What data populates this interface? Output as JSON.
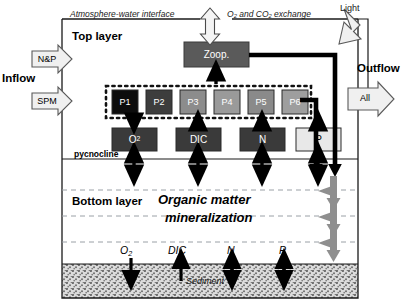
{
  "figure": {
    "type": "diagram",
    "canvas": {
      "width": 408,
      "height": 308
    }
  },
  "top": {
    "atmosphere_label": "Atmosphere-water interface",
    "exchange_label_a": "O",
    "exchange_label_a_sub": "2",
    "exchange_label_b": " and CO",
    "exchange_label_b_sub": "2",
    "exchange_label_c": " exchange",
    "light_label": "Light",
    "top_layer_label": "Top layer"
  },
  "inflow": {
    "title": "Inflow",
    "arrows": [
      {
        "label": "N&P"
      },
      {
        "label": "SPM"
      }
    ]
  },
  "outflow": {
    "title": "Outflow",
    "arrow_label": "All"
  },
  "zooplankton": {
    "label": "Zoop."
  },
  "phytoplankton": {
    "group_label": "phytoplankton group",
    "boxes": [
      {
        "label": "P1",
        "fill": "#0c0c0c",
        "text": "#ffffff"
      },
      {
        "label": "P2",
        "fill": "#3d3d3d",
        "text": "#ffffff"
      },
      {
        "label": "P3",
        "fill": "#8c8c8c",
        "text": "#ffffff"
      },
      {
        "label": "P4",
        "fill": "#9a9a9a",
        "text": "#ffffff"
      },
      {
        "label": "P5",
        "fill": "#8a8a8a",
        "text": "#ffffff"
      },
      {
        "label": "P6",
        "fill": "#9e9e9e",
        "text": "#ffffff"
      }
    ]
  },
  "nutrients": [
    {
      "label": "O",
      "sub": "2",
      "fill": "#3a3a3a",
      "text": "#ffffff"
    },
    {
      "label": "DIC",
      "sub": "",
      "fill": "#3a3a3a",
      "text": "#ffffff"
    },
    {
      "label": "N",
      "sub": "",
      "fill": "#3a3a3a",
      "text": "#ffffff"
    },
    {
      "label": "P",
      "sub": "",
      "fill": "#e8e8e8",
      "text": "#000000"
    }
  ],
  "pycnocline": {
    "label": "pycnocline"
  },
  "bottom": {
    "layer_label": "Bottom layer",
    "process_line1": "Organic matter",
    "process_line2": "mineralization"
  },
  "sediment": {
    "label": "Sediment",
    "fluxes": [
      {
        "label": "O",
        "sub": "2"
      },
      {
        "label": "DIC",
        "sub": ""
      },
      {
        "label": "N",
        "sub": ""
      },
      {
        "label": "P",
        "sub": ""
      }
    ]
  },
  "colors": {
    "frame": "#1a1a1a",
    "thick_flow": "#000000",
    "dashed_grid": "#9aa0a6",
    "sediment_fill": "#d8d8d8",
    "block_arrow_fill": "#f0f0f0",
    "sinking_arrow": "#8f8f8f",
    "zoop_fill": "#5a5a5a"
  }
}
